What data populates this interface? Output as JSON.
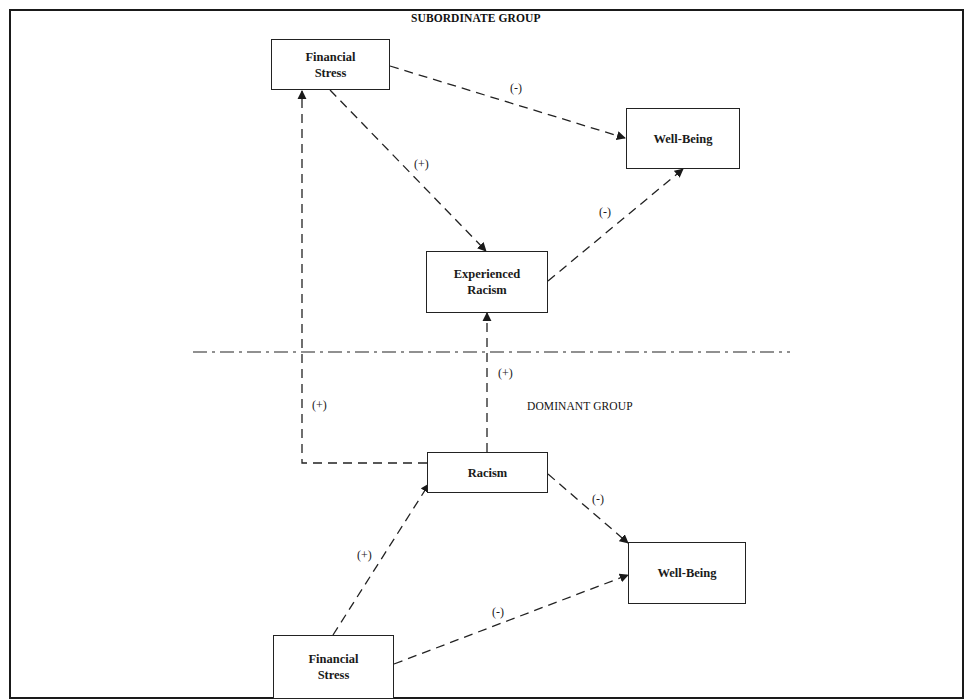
{
  "diagram": {
    "groups": {
      "subordinate": "SUBORDINATE GROUP",
      "dominant": "DOMINANT GROUP"
    },
    "nodes": {
      "sub_financial_stress": "Financial\nStress",
      "sub_well_being": "Well-Being",
      "sub_experienced_racism": "Experienced\nRacism",
      "dom_racism": "Racism",
      "dom_well_being": "Well-Being",
      "dom_financial_stress": "Financial\nStress"
    },
    "edges": [
      {
        "from": "sub_financial_stress",
        "to": "sub_well_being",
        "sign": "(-)"
      },
      {
        "from": "sub_financial_stress",
        "to": "sub_experienced_racism",
        "sign": "(+)"
      },
      {
        "from": "sub_experienced_racism",
        "to": "sub_well_being",
        "sign": "(-)"
      },
      {
        "from": "dom_racism",
        "to": "sub_experienced_racism",
        "sign": "(+)"
      },
      {
        "from": "dom_racism",
        "to": "sub_financial_stress",
        "sign": "(+)"
      },
      {
        "from": "dom_racism",
        "to": "dom_well_being",
        "sign": "(-)"
      },
      {
        "from": "dom_financial_stress",
        "to": "dom_racism",
        "sign": "(+)"
      },
      {
        "from": "dom_financial_stress",
        "to": "dom_well_being",
        "sign": "(-)"
      }
    ],
    "line_style": "dashed",
    "separator_style": "dash-dot"
  }
}
